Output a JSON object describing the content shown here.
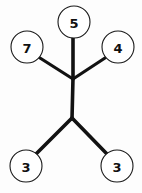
{
  "diagram": {
    "type": "tree-graph",
    "background_color": "#fdfdfd",
    "edge_color": "#121212",
    "node_fill_color": "#ffffff",
    "node_stroke_color": "#1a1a1a",
    "nodes": [
      {
        "id": "n5",
        "label": "5",
        "cx": 74,
        "cy": 22,
        "r": 16
      },
      {
        "id": "n7",
        "label": "7",
        "cx": 27,
        "cy": 47,
        "r": 16
      },
      {
        "id": "n4",
        "label": "4",
        "cx": 118,
        "cy": 47,
        "r": 16
      },
      {
        "id": "n3a",
        "label": "3",
        "cx": 26,
        "cy": 166,
        "r": 16
      },
      {
        "id": "n3b",
        "label": "3",
        "cx": 117,
        "cy": 166,
        "r": 16
      }
    ],
    "junctions": [
      {
        "id": "jUpper",
        "cx": 73,
        "cy": 78
      },
      {
        "id": "jLower",
        "cx": 72,
        "cy": 118
      }
    ],
    "edges": [
      {
        "id": "e-5-upper",
        "from": "n5",
        "to": "jUpper",
        "x1": 73,
        "y1": 38,
        "x2": 73,
        "y2": 78
      },
      {
        "id": "e-7-upper",
        "from": "n7",
        "to": "jUpper",
        "x1": 40,
        "y1": 58,
        "x2": 73,
        "y2": 78
      },
      {
        "id": "e-4-upper",
        "from": "n4",
        "to": "jUpper",
        "x1": 105,
        "y1": 58,
        "x2": 73,
        "y2": 78
      },
      {
        "id": "e-upper-lower",
        "from": "jUpper",
        "to": "jLower",
        "x1": 73,
        "y1": 78,
        "x2": 72,
        "y2": 118
      },
      {
        "id": "e-lower-3a",
        "from": "jLower",
        "to": "n3a",
        "x1": 72,
        "y1": 118,
        "x2": 36,
        "y2": 154
      },
      {
        "id": "e-lower-3b",
        "from": "jLower",
        "to": "n3b",
        "x1": 72,
        "y1": 118,
        "x2": 107,
        "y2": 154
      }
    ]
  }
}
